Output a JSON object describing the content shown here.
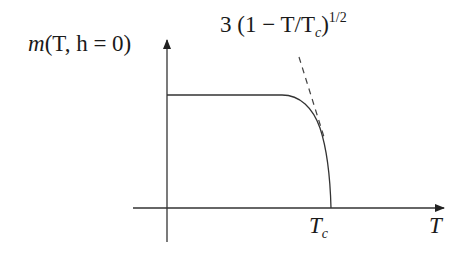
{
  "diagram": {
    "y_axis": {
      "label_func": "m",
      "label_args": "(T, h = 0)",
      "label_full": "m(T, h = 0)"
    },
    "x_axis": {
      "label": "T"
    },
    "critical_point": {
      "symbol": "T",
      "subscript": "c",
      "label_full": "T_c"
    },
    "asymptote": {
      "coefficient": "3",
      "base": "(1 − T/T",
      "base_sub": "c",
      "close": ")",
      "exponent": "1/2",
      "label_full": "3 (1 − T/T_c)^{1/2}",
      "style": "dashed"
    },
    "curve": {
      "description": "flat plateau then sharp drop to zero at T_c",
      "style": "solid"
    },
    "colors": {
      "line": "#333333",
      "text": "#1a1a1a",
      "background": "#ffffff"
    }
  }
}
